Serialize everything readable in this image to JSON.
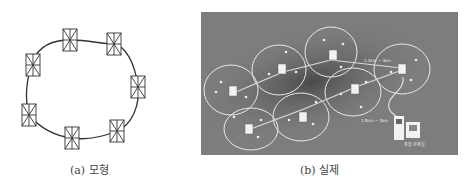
{
  "figure": {
    "panels": [
      {
        "id": "a",
        "caption": "(a) 모형",
        "description": "Model: 7 sensor nodes connected in a closed loop",
        "nodes": [
          {
            "x": 70,
            "y": 40
          },
          {
            "x": 114,
            "y": 44
          },
          {
            "x": 138,
            "y": 87
          },
          {
            "x": 117,
            "y": 131
          },
          {
            "x": 72,
            "y": 138
          },
          {
            "x": 29,
            "y": 115
          },
          {
            "x": 33,
            "y": 65
          }
        ]
      },
      {
        "id": "b",
        "caption": "(b) 실제",
        "description": "Actual deployment over aerial photo with coverage ellipses",
        "labels": {
          "link_top": "1.2km ~ 3km",
          "link_bottom": "1.5km ~ 3km",
          "control_room": "종합 관제실"
        },
        "colors": {
          "background": "#7d7d7d",
          "ellipse": "#e8e8e8",
          "node": "#f2f2f2"
        }
      }
    ]
  }
}
